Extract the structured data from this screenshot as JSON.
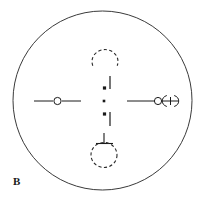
{
  "figure": {
    "panel_label": "B",
    "background_color": "#ffffff",
    "stroke_color": "#3a3a3a",
    "ink_color": "#1a1a1a",
    "width": 209,
    "height": 203
  },
  "chart_data": {
    "type": "scatter",
    "title": "",
    "subtitle": "",
    "xlabel": "",
    "ylabel": "",
    "grid": false,
    "legend": "none",
    "xlim": [
      0,
      209
    ],
    "ylim": [
      0,
      203
    ],
    "annotations": [
      {
        "name": "panel-label",
        "text": "B",
        "x": 16,
        "y": 182
      }
    ],
    "elements": [
      {
        "name": "outer-ellipse",
        "shape": "ellipse",
        "cx": 102.5,
        "cy": 100.5,
        "rx": 89.5,
        "ry": 89.5,
        "fill": "none",
        "stroke": "#3a3a3a",
        "stroke_width": 1.0,
        "dashed": false
      },
      {
        "name": "center-dot",
        "shape": "square-dot",
        "cx": 104,
        "cy": 101,
        "size": 2.6,
        "fill": "#1a1a1a",
        "stroke": "none",
        "stroke_width": 0,
        "dashed": false
      },
      {
        "name": "upper-vertical-line",
        "shape": "line",
        "x1": 110,
        "y1": 76,
        "x2": 110,
        "y2": 89,
        "fill": "none",
        "stroke": "#1a1a1a",
        "stroke_width": 1.2,
        "dashed": false
      },
      {
        "name": "upper-square-dot",
        "shape": "square-dot",
        "cx": 104.5,
        "cy": 88,
        "size": 3.2,
        "fill": "#1a1a1a",
        "stroke": "none",
        "stroke_width": 0,
        "dashed": false
      },
      {
        "name": "lower-vertical-line",
        "shape": "line",
        "x1": 110,
        "y1": 112,
        "x2": 110,
        "y2": 126,
        "fill": "none",
        "stroke": "#1a1a1a",
        "stroke_width": 1.2,
        "dashed": false
      },
      {
        "name": "lower-square-dot",
        "shape": "square-dot",
        "cx": 104.5,
        "cy": 114,
        "size": 3.2,
        "fill": "#1a1a1a",
        "stroke": "none",
        "stroke_width": 0,
        "dashed": false
      },
      {
        "name": "top-dashed-arc",
        "shape": "arc",
        "cx": 105,
        "cy": 58,
        "rx": 13,
        "ry": 12,
        "start_deg": 200,
        "end_deg": 520,
        "fill": "none",
        "stroke": "#2a2a2a",
        "stroke_width": 1.1,
        "dashed": true,
        "dash_pattern": "3.2 2.4"
      },
      {
        "name": "bottom-dashed-circle",
        "shape": "circle",
        "cx": 104,
        "cy": 155,
        "rx": 13,
        "ry": 12.5,
        "fill": "none",
        "stroke": "#2a2a2a",
        "stroke_width": 1.1,
        "dashed": true,
        "dash_pattern": "3.2 2.4"
      },
      {
        "name": "bottom-stem-line",
        "shape": "line",
        "x1": 104,
        "y1": 133,
        "x2": 104,
        "y2": 144,
        "fill": "none",
        "stroke": "#1a1a1a",
        "stroke_width": 1.1,
        "dashed": false
      },
      {
        "name": "bottom-crossbar-line",
        "shape": "line",
        "x1": 96,
        "y1": 143.5,
        "x2": 113,
        "y2": 143.5,
        "fill": "none",
        "stroke": "#1a1a1a",
        "stroke_width": 1.1,
        "dashed": false
      },
      {
        "name": "left-arm-inner-line",
        "shape": "line",
        "x1": 34,
        "y1": 101,
        "x2": 53,
        "y2": 101,
        "fill": "none",
        "stroke": "#1a1a1a",
        "stroke_width": 1.0,
        "dashed": false
      },
      {
        "name": "left-arm-outer-line",
        "shape": "line",
        "x1": 62,
        "y1": 101,
        "x2": 81,
        "y2": 101,
        "fill": "none",
        "stroke": "#1a1a1a",
        "stroke_width": 1.0,
        "dashed": false
      },
      {
        "name": "left-open-circle",
        "shape": "circle",
        "cx": 57.5,
        "cy": 101,
        "rx": 3.6,
        "ry": 3.6,
        "fill": "#ffffff",
        "stroke": "#1a1a1a",
        "stroke_width": 1.0,
        "dashed": false
      },
      {
        "name": "right-arm-inner-line",
        "shape": "line",
        "x1": 127,
        "y1": 101,
        "x2": 154,
        "y2": 101,
        "fill": "none",
        "stroke": "#1a1a1a",
        "stroke_width": 1.0,
        "dashed": false
      },
      {
        "name": "right-open-circle",
        "shape": "circle",
        "cx": 158,
        "cy": 101,
        "rx": 3.6,
        "ry": 3.6,
        "fill": "#ffffff",
        "stroke": "#1a1a1a",
        "stroke_width": 1.0,
        "dashed": false
      },
      {
        "name": "right-arrow-shaft-line",
        "shape": "line",
        "x1": 163,
        "y1": 101,
        "x2": 178,
        "y2": 101,
        "fill": "none",
        "stroke": "#1a1a1a",
        "stroke_width": 1.0,
        "dashed": false
      },
      {
        "name": "right-arrow-left-bracket",
        "shape": "arc",
        "cx": 170.5,
        "cy": 101,
        "rx": 7.5,
        "ry": 6,
        "start_deg": 120,
        "end_deg": 240,
        "fill": "none",
        "stroke": "#1a1a1a",
        "stroke_width": 1.0,
        "dashed": false
      },
      {
        "name": "right-arrow-right-bracket",
        "shape": "arc",
        "cx": 170.5,
        "cy": 101,
        "rx": 7.5,
        "ry": 6,
        "start_deg": -60,
        "end_deg": 60,
        "fill": "none",
        "stroke": "#1a1a1a",
        "stroke_width": 1.0,
        "dashed": false
      },
      {
        "name": "right-arrow-vertical-tick",
        "shape": "line",
        "x1": 170.5,
        "y1": 97,
        "x2": 170.5,
        "y2": 105,
        "fill": "none",
        "stroke": "#1a1a1a",
        "stroke_width": 1.0,
        "dashed": false
      }
    ]
  }
}
